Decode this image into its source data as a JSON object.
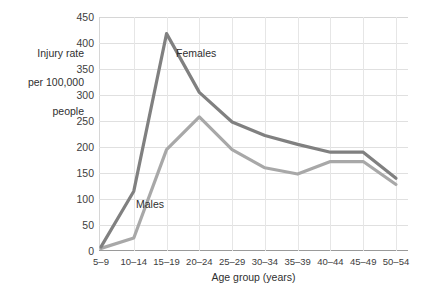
{
  "chart_data": {
    "type": "line",
    "title": "",
    "xlabel": "Age group (years)",
    "ylabel": "Injury rate\nper 100,000\npeople",
    "categories": [
      "5–9",
      "10–14",
      "15–19",
      "20–24",
      "25–29",
      "30–34",
      "35–39",
      "40–44",
      "45–49",
      "50–54"
    ],
    "series": [
      {
        "name": "Females",
        "color": "#808080",
        "values": [
          8,
          115,
          418,
          305,
          248,
          222,
          205,
          190,
          190,
          140
        ]
      },
      {
        "name": "Males",
        "color": "#a8a8a8",
        "values": [
          5,
          25,
          195,
          258,
          195,
          160,
          148,
          172,
          172,
          128
        ]
      }
    ],
    "ylim": [
      0,
      450
    ],
    "yticks": [
      0,
      50,
      100,
      150,
      200,
      250,
      300,
      350,
      400,
      450
    ],
    "ytick_labels": [
      "0",
      "50",
      "100",
      "150",
      "200",
      "250",
      "300",
      "350",
      "400",
      "450"
    ],
    "grid": "both",
    "legend_position": "inline-annotations",
    "annotations": [
      {
        "text": "Females",
        "series": "Females"
      },
      {
        "text": "Males",
        "series": "Males"
      }
    ]
  },
  "axis": {
    "y_title_line1": "Injury rate",
    "y_title_line2": "per 100,000",
    "y_title_line3": "people",
    "x_title": "Age group (years)"
  },
  "stray": {
    "clipped_text": ")"
  }
}
